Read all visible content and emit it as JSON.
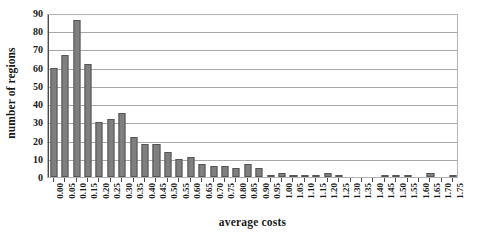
{
  "chart_data": {
    "type": "bar",
    "title": "",
    "xlabel": "average costs",
    "ylabel": "number of regions",
    "ylim": [
      0,
      90
    ],
    "ytick_step": 10,
    "yticks": [
      "0",
      "10",
      "20",
      "30",
      "40",
      "50",
      "60",
      "70",
      "80",
      "90"
    ],
    "grid": true,
    "legend": false,
    "bar_color": "#7f7f7f",
    "bar_edge_color": "#565656",
    "axis_color": "#4a4a4a",
    "gridline_color": "#a8a8a8",
    "categories": [
      "0.00",
      "0.05",
      "0.10",
      "0.15",
      "0.20",
      "0.25",
      "0.30",
      "0.35",
      "0.40",
      "0.45",
      "0.50",
      "0.55",
      "0.60",
      "0.65",
      "0.70",
      "0.75",
      "0.80",
      "0.85",
      "0.90",
      "0.95",
      "1.00",
      "1.05",
      "1.10",
      "1.15",
      "1.20",
      "1.25",
      "1.30",
      "1.35",
      "1.40",
      "1.45",
      "1.50",
      "1.55",
      "1.60",
      "1.65",
      "1.70",
      "1.75"
    ],
    "values": [
      60,
      67,
      86,
      62,
      30,
      32,
      35,
      22,
      18,
      18,
      14,
      10,
      11,
      7,
      6,
      6,
      5,
      7,
      5,
      1,
      2,
      1,
      1,
      1,
      2,
      1,
      0,
      0,
      0,
      1,
      1,
      1,
      0,
      2,
      0,
      1
    ]
  }
}
